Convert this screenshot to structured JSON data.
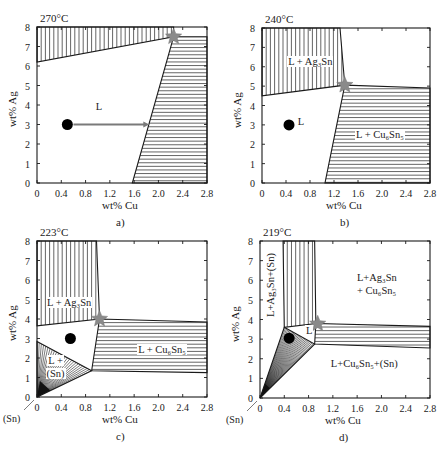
{
  "figure": {
    "xaxis_label": "wt% Cu",
    "yaxis_label": "wt% Ag",
    "x_ticks": [
      "0",
      "0.4",
      "0.8",
      "1.2",
      "1.6",
      "2.0",
      "2.4",
      "2.8"
    ],
    "y_ticks": [
      "0",
      "1",
      "2",
      "3",
      "4",
      "5",
      "6",
      "7",
      "8"
    ],
    "colors": {
      "line": "#1a1a1a",
      "star": "#8a8a8a",
      "dot": "#000000",
      "arrow": "#7a7a7a"
    }
  },
  "panels": [
    {
      "id": "a",
      "temperature": "270°C",
      "caption": "a)",
      "regions": [
        {
          "hatch": "vertical",
          "points": [
            [
              0,
              8
            ],
            [
              2.25,
              8
            ],
            [
              2.25,
              7.5
            ],
            [
              0,
              6.2
            ]
          ]
        },
        {
          "hatch": "horizontal",
          "points": [
            [
              2.25,
              7.5
            ],
            [
              2.8,
              7.5
            ],
            [
              2.8,
              0
            ],
            [
              1.57,
              0
            ]
          ]
        }
      ],
      "labels": [
        {
          "text": "L",
          "x": 0.95,
          "y": 3.9
        }
      ],
      "star": [
        2.25,
        7.5
      ],
      "dot": [
        0.5,
        3.0
      ],
      "arrow": {
        "from": [
          0.6,
          3.0
        ],
        "to": [
          1.85,
          3.0
        ]
      }
    },
    {
      "id": "b",
      "temperature": "240°C",
      "caption": "b)",
      "regions": [
        {
          "hatch": "vertical",
          "points": [
            [
              0,
              8
            ],
            [
              1.3,
              8
            ],
            [
              1.38,
              5.05
            ],
            [
              0,
              4.5
            ]
          ]
        },
        {
          "hatch": "horizontal",
          "points": [
            [
              1.38,
              5.05
            ],
            [
              2.8,
              4.9
            ],
            [
              2.8,
              0
            ],
            [
              1.05,
              0
            ]
          ]
        }
      ],
      "labels": [
        {
          "text": "L + Ag₃Sn",
          "x": 0.42,
          "y": 6.25
        },
        {
          "text": "L",
          "x": 0.58,
          "y": 3.15
        },
        {
          "text": "L + Cu₆Sn₅",
          "x": 1.55,
          "y": 2.5
        }
      ],
      "star": [
        1.38,
        5.05
      ],
      "dot": [
        0.45,
        3.0
      ],
      "arrow": null
    },
    {
      "id": "c",
      "temperature": "223°C",
      "caption": "c)",
      "regions": [
        {
          "hatch": "vertical",
          "points": [
            [
              0,
              8
            ],
            [
              0.98,
              8
            ],
            [
              1.03,
              4.0
            ],
            [
              0,
              3.65
            ]
          ]
        },
        {
          "hatch": "horizontal",
          "points": [
            [
              1.03,
              4.0
            ],
            [
              2.8,
              3.85
            ],
            [
              2.8,
              1.25
            ],
            [
              0.9,
              1.35
            ]
          ]
        },
        {
          "hatch": "fan",
          "points": [
            [
              0,
              2.85
            ],
            [
              0.9,
              1.35
            ],
            [
              0,
              0
            ]
          ]
        }
      ],
      "labels": [
        {
          "text": "L + Ag₃Sn",
          "x": 0.15,
          "y": 4.8
        },
        {
          "text": "L + Cu₆Sn₅",
          "x": 1.65,
          "y": 2.4
        },
        {
          "text": "L +",
          "x": 0.17,
          "y": 1.85
        },
        {
          "text": "(Sn)",
          "x": 0.14,
          "y": 1.2
        }
      ],
      "star": [
        1.03,
        4.0
      ],
      "dot": [
        0.55,
        3.0
      ],
      "arrow": null,
      "sn_marker": "(Sn)"
    },
    {
      "id": "d",
      "temperature": "219°C",
      "caption": "d)",
      "regions": [
        {
          "hatch": "vertical",
          "points": [
            [
              0.38,
              8
            ],
            [
              0.9,
              8
            ],
            [
              0.92,
              3.8
            ],
            [
              0.4,
              3.6
            ]
          ]
        },
        {
          "hatch": "horizontal",
          "points": [
            [
              0.92,
              3.8
            ],
            [
              2.8,
              3.65
            ],
            [
              2.8,
              2.55
            ],
            [
              0.9,
              2.75
            ]
          ]
        },
        {
          "hatch": "fan",
          "points": [
            [
              0.4,
              3.6
            ],
            [
              0.9,
              2.75
            ],
            [
              0,
              0
            ]
          ]
        }
      ],
      "labels": [
        {
          "text": "L+Ag₃Sn",
          "x": 1.58,
          "y": 6.1
        },
        {
          "text": "+ Cu₆Sn₅",
          "x": 1.58,
          "y": 5.45
        },
        {
          "text": "L",
          "x": 0.74,
          "y": 3.4
        },
        {
          "text": "L+Cu₆Sn₅+(Sn)",
          "x": 1.15,
          "y": 1.75
        }
      ],
      "vertical_label": "L+Ag₃Sn+(Sn)",
      "star": [
        0.95,
        3.78
      ],
      "dot": [
        0.48,
        3.05
      ],
      "arrow": null,
      "sn_marker": "(Sn)"
    }
  ],
  "chart_data": {
    "type": "table",
    "xlabel": "wt% Cu",
    "ylabel": "wt% Ag",
    "xlim": [
      0,
      2.8
    ],
    "ylim": [
      0,
      8
    ],
    "panels": [
      {
        "panel": "a",
        "temperature_C": 270,
        "phases": [
          "L",
          "L + Ag3Sn (vertical hatch, top)",
          "L + Cu6Sn5 (horizontal hatch, right)"
        ],
        "three_phase_point": {
          "Cu": 2.25,
          "Ag": 7.5
        },
        "alloy_point": {
          "Cu": 0.5,
          "Ag": 3.0
        },
        "arrow_to": {
          "Cu": 1.85,
          "Ag": 3.0
        }
      },
      {
        "panel": "b",
        "temperature_C": 240,
        "phases": [
          "L",
          "L + Ag3Sn",
          "L + Cu6Sn5"
        ],
        "three_phase_point": {
          "Cu": 1.38,
          "Ag": 5.05
        },
        "alloy_point": {
          "Cu": 0.45,
          "Ag": 3.0
        }
      },
      {
        "panel": "c",
        "temperature_C": 223,
        "phases": [
          "L",
          "L + Ag3Sn",
          "L + Cu6Sn5",
          "L + (Sn)"
        ],
        "three_phase_point": {
          "Cu": 1.03,
          "Ag": 4.0
        },
        "alloy_point": {
          "Cu": 0.55,
          "Ag": 3.0
        }
      },
      {
        "panel": "d",
        "temperature_C": 219,
        "phases": [
          "L",
          "L+Ag3Sn+(Sn)",
          "L+Ag3Sn + Cu6Sn5",
          "L+Cu6Sn5+(Sn)"
        ],
        "three_phase_point": {
          "Cu": 0.95,
          "Ag": 3.78
        },
        "alloy_point": {
          "Cu": 0.48,
          "Ag": 3.05
        }
      }
    ]
  }
}
